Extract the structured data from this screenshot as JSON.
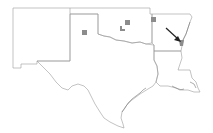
{
  "map": {
    "title": "",
    "region": "South-central United States",
    "states": [
      "New Mexico",
      "Texas",
      "Oklahoma",
      "Arkansas",
      "Louisiana"
    ],
    "colors": {
      "border": "#9a9a9a",
      "county_fill": "#8c8c8c",
      "arrow": "#222222",
      "background": "#ffffff"
    },
    "highlighted_counties": [
      {
        "id": "tx-panhandle-square",
        "x": 84,
        "y": 32
      },
      {
        "id": "ok-central-square",
        "x": 127,
        "y": 22
      },
      {
        "id": "ok-northeast-square",
        "x": 153,
        "y": 19
      },
      {
        "id": "ok-small-marker",
        "x": 121,
        "y": 28
      },
      {
        "id": "ar-southeast-arrowed",
        "x": 181,
        "y": 42
      }
    ],
    "arrow": {
      "from": [
        166,
        28
      ],
      "to": [
        180,
        41
      ],
      "icon": "arrow-down-right-icon"
    }
  }
}
